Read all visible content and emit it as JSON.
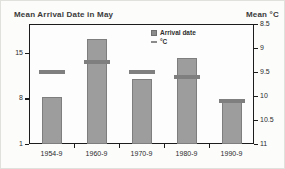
{
  "header": {
    "title": "Mean Arrival Date in May",
    "right_title": "Mean °C"
  },
  "legend": {
    "items": [
      {
        "symbol": "square-icon",
        "label": "Arrival date"
      },
      {
        "symbol": "dash-icon",
        "label": "°C"
      }
    ]
  },
  "colors": {
    "bar_fill": "#9d9d9d",
    "bar_border": "#7e7e7e",
    "dash": "#7f7f7f",
    "frame": "#1c1c1c",
    "text": "#2b2b2b",
    "background": "#fcfcfb"
  },
  "chart_data": {
    "type": "bar",
    "title": "Mean Arrival Date in May",
    "subtitle": "",
    "categories": [
      "1954-9",
      "1960-9",
      "1970-9",
      "1980-9",
      "1990-9"
    ],
    "series": [
      {
        "name": "Arrival date",
        "kind": "bar",
        "axis": "left",
        "values": [
          8.2,
          17.2,
          11,
          14.2,
          8
        ]
      },
      {
        "name": "°C",
        "kind": "dash-marker",
        "axis": "right",
        "values": [
          9.5,
          9.3,
          9.5,
          9.6,
          10.1
        ]
      }
    ],
    "left_axis": {
      "label": "Mean Arrival Date in May",
      "ticks": [
        15,
        8,
        1
      ],
      "min": 1,
      "max": 19.5
    },
    "right_axis": {
      "label": "Mean °C",
      "ticks": [
        8.5,
        9,
        9.5,
        10,
        10.5,
        11
      ],
      "min": 8.5,
      "max": 11,
      "direction": "increasing-downward"
    },
    "xlabel": "",
    "ylabel": "",
    "grid": false,
    "legend_position": "inside-top-center"
  }
}
